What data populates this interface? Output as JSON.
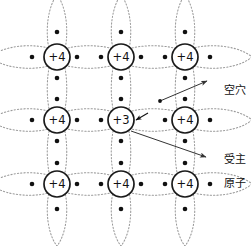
{
  "figure": {
    "type": "semiconductor-lattice-diagram",
    "caption": "",
    "colors": {
      "background": "#ffffff",
      "atom_outline": "#1a1a1a",
      "orbital_dotted": "#9a9a9a",
      "electron": "#111111",
      "annotation_line": "#333333",
      "text": "#111111"
    }
  },
  "lattice": {
    "columns_x": [
      57,
      121,
      185
    ],
    "rows_y": [
      57,
      120,
      184
    ],
    "atom_radius": 13,
    "atoms": [
      {
        "id": "a00",
        "label": "+4",
        "col": 0,
        "row": 0,
        "cx": 57,
        "cy": 57
      },
      {
        "id": "a10",
        "label": "+4",
        "col": 1,
        "row": 0,
        "cx": 121,
        "cy": 57
      },
      {
        "id": "a20",
        "label": "+4",
        "col": 2,
        "row": 0,
        "cx": 185,
        "cy": 57
      },
      {
        "id": "a01",
        "label": "+4",
        "col": 0,
        "row": 1,
        "cx": 57,
        "cy": 120
      },
      {
        "id": "a11",
        "label": "+3",
        "col": 1,
        "row": 1,
        "cx": 121,
        "cy": 120
      },
      {
        "id": "a21",
        "label": "+4",
        "col": 2,
        "row": 1,
        "cx": 185,
        "cy": 120
      },
      {
        "id": "a02",
        "label": "+4",
        "col": 0,
        "row": 2,
        "cx": 57,
        "cy": 184
      },
      {
        "id": "a12",
        "label": "+4",
        "col": 1,
        "row": 2,
        "cx": 121,
        "cy": 184
      },
      {
        "id": "a22",
        "label": "+4",
        "col": 2,
        "row": 2,
        "cx": 185,
        "cy": 184
      }
    ],
    "acceptor_atom_id": "a11",
    "hole_position": {
      "x": 141,
      "y": 120
    }
  },
  "annotations": [
    {
      "id": "hole",
      "text": "空穴",
      "label_x": 210,
      "label_y": 73,
      "arrow_from": {
        "x": 160,
        "y": 101
      },
      "arrow_to": {
        "x": 207,
        "y": 81
      }
    },
    {
      "id": "acceptor",
      "line1": "受主",
      "line2": "原子",
      "label_x": 210,
      "label_y": 142,
      "arrow_from": {
        "x": 131,
        "y": 131
      },
      "arrow_to": {
        "x": 206,
        "y": 157
      }
    }
  ],
  "hole_marker": {
    "id": "hole-arrow",
    "from": {
      "x": 148,
      "y": 113
    },
    "to": {
      "x": 136,
      "y": 120
    }
  }
}
